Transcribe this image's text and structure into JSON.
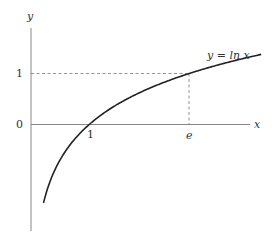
{
  "chart_data": {
    "type": "line",
    "title": "",
    "xlabel": "x",
    "ylabel": "y",
    "curve_label": "y = ln x",
    "function": "ln(x)",
    "x_ticks": [
      {
        "value": 1,
        "label": "1"
      },
      {
        "value": 2.718,
        "label": "e"
      }
    ],
    "y_ticks": [
      {
        "value": 0,
        "label": "0"
      },
      {
        "value": 1,
        "label": "1"
      }
    ],
    "series": [
      {
        "name": "y = ln x",
        "x": [
          0.2,
          0.3,
          0.5,
          0.75,
          1,
          1.5,
          2,
          2.718,
          3,
          3.5,
          4.0
        ],
        "values": [
          -1.61,
          -1.2,
          -0.69,
          -0.29,
          0,
          0.41,
          0.69,
          1,
          1.1,
          1.25,
          1.39
        ]
      }
    ],
    "guides": [
      {
        "type": "dashed-horizontal",
        "y": 1,
        "from_x": 0,
        "to_x": 2.718
      },
      {
        "type": "dashed-vertical",
        "x": 2.718,
        "from_y": 0,
        "to_y": 1
      }
    ],
    "xlim": [
      0,
      4.0
    ],
    "ylim": [
      -1.98,
      1.9
    ],
    "grid": false,
    "legend": "none"
  },
  "labels": {
    "y_axis": "y",
    "x_axis": "x",
    "curve": "y = ln x",
    "tick_one_y": "1",
    "tick_zero_y": "0",
    "tick_one_x": "1",
    "tick_e_x": "e"
  }
}
